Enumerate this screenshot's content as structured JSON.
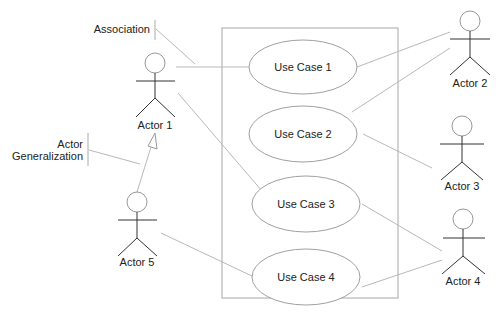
{
  "diagram": {
    "type": "uml-use-case",
    "colors": {
      "line": "#b8b8b8",
      "actor": "#333333",
      "text": "#222222",
      "background": "#ffffff"
    },
    "annotations": [
      {
        "id": "association",
        "label": "Association"
      },
      {
        "id": "actor-generalization",
        "label_line1": "Actor",
        "label_line2": "Generalization"
      }
    ],
    "actors": [
      {
        "id": "actor1",
        "label": "Actor 1"
      },
      {
        "id": "actor2",
        "label": "Actor 2"
      },
      {
        "id": "actor3",
        "label": "Actor 3"
      },
      {
        "id": "actor4",
        "label": "Actor 4"
      },
      {
        "id": "actor5",
        "label": "Actor 5"
      }
    ],
    "use_cases": [
      {
        "id": "uc1",
        "label": "Use Case 1"
      },
      {
        "id": "uc2",
        "label": "Use Case 2"
      },
      {
        "id": "uc3",
        "label": "Use Case 3"
      },
      {
        "id": "uc4",
        "label": "Use Case 4"
      }
    ],
    "associations": [
      {
        "from": "Actor 1",
        "to": "Use Case 1"
      },
      {
        "from": "Actor 1",
        "to": "Use Case 3"
      },
      {
        "from": "Actor 2",
        "to": "Use Case 1"
      },
      {
        "from": "Actor 2",
        "to": "Use Case 2"
      },
      {
        "from": "Actor 3",
        "to": "Use Case 2"
      },
      {
        "from": "Actor 4",
        "to": "Use Case 3"
      },
      {
        "from": "Actor 4",
        "to": "Use Case 4"
      },
      {
        "from": "Actor 5",
        "to": "Use Case 4"
      }
    ],
    "generalizations": [
      {
        "child": "Actor 5",
        "parent": "Actor 1"
      }
    ]
  }
}
